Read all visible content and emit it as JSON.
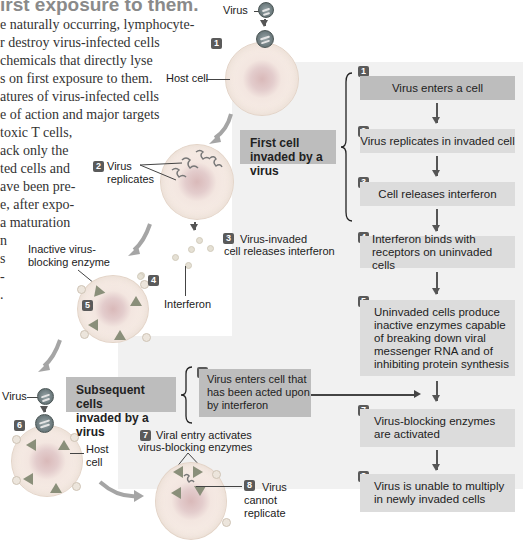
{
  "text_column": {
    "heading_fragment": "irst exposure to them.",
    "lines": [
      "e naturally occurring, lymphocyte-",
      "r destroy virus-infected cells",
      "chemicals that directly lyse",
      "s on first exposure to them.",
      "atures of virus-infected cells",
      "e of action and major targets",
      "toxic T cells,",
      "ack only the",
      "ted cells and",
      "ave been pre-",
      "e, after expo-",
      "a maturation",
      "n",
      "s",
      "-",
      "."
    ]
  },
  "diagram": {
    "left_illustration": {
      "virus_label_top": "Virus",
      "host_cell_label_top": "Host cell",
      "step_2_label": "Virus\nreplicates",
      "step_3_label_line1": "Virus-invaded",
      "step_3_label_line2": "cell releases interferon",
      "interferon_label": "Interferon",
      "inactive_enzyme_label_line1": "Inactive virus-",
      "inactive_enzyme_label_line2": "blocking enzyme",
      "virus_label_bottom": "Virus",
      "host_cell_label_bottom_line1": "Host",
      "host_cell_label_bottom_line2": "cell",
      "step_7_label_line1": "Viral entry activates",
      "step_7_label_line2": "virus-blocking enzymes",
      "step_8_label_line1": "Virus",
      "step_8_label_line2": "cannot",
      "step_8_label_line3": "replicate"
    },
    "group_labels": {
      "first": {
        "line1": "First cell",
        "line2": "invaded by a virus"
      },
      "subsequent": {
        "line1": "Subsequent cells",
        "line2": "invaded by a virus"
      }
    },
    "flow_steps": [
      {
        "number": "1",
        "text": "Virus enters a cell"
      },
      {
        "number": "2",
        "text": "Virus replicates in invaded cell"
      },
      {
        "number": "3",
        "text": "Cell releases interferon"
      },
      {
        "number": "4",
        "text": "Interferon binds with receptors on uninvaded cells",
        "line1": "Interferon binds with",
        "line2": "receptors on uninvaded cells"
      },
      {
        "number": "5",
        "text": "Uninvaded cells produce inactive enzymes capable of breaking down viral messenger RNA and of inhibiting protein synthesis",
        "line1": "Uninvaded cells produce",
        "line2": "inactive enzymes capable",
        "line3": "of breaking down viral",
        "line4": "messenger RNA and of",
        "line5": "inhibiting protein synthesis"
      },
      {
        "number": "6",
        "text": "Virus enters cell that has been acted upon by interferon",
        "line1": "Virus enters cell that",
        "line2": "has been acted upon",
        "line3": "by interferon"
      },
      {
        "number": "7",
        "text": "Virus-blocking enzymes are activated",
        "line1": "Virus-blocking enzymes",
        "line2": "are activated"
      },
      {
        "number": "8",
        "text": "Virus is unable to multiply in newly invaded cells",
        "line1": "Virus is unable to multiply",
        "line2": "in newly invaded cells"
      }
    ],
    "colors": {
      "panel_bg": "#f1f1f1",
      "step_box_light": "#dcdcdc",
      "step_box_dark": "#bdbdbd",
      "badge": "#5a5a5a",
      "arrow": "#555555",
      "curved_arrow": "#9a9a9a"
    }
  }
}
